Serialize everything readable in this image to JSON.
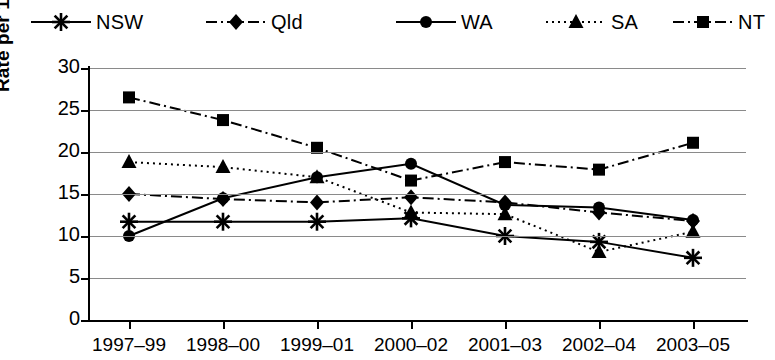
{
  "chart_data": {
    "type": "line",
    "title": "",
    "subtitle": "",
    "xlabel": "",
    "ylabel": "Rate per 1000 live births",
    "categories": [
      "1997–99",
      "1998–00",
      "1999–01",
      "2000–02",
      "2001–03",
      "2002–04",
      "2003–05"
    ],
    "ylim": [
      0,
      30
    ],
    "yticks": [
      0,
      5,
      10,
      15,
      20,
      25,
      30
    ],
    "ytick_labels": [
      "0",
      "5",
      "10",
      "15",
      "20",
      "25",
      "30"
    ],
    "grid": true,
    "grid_axis": "y",
    "legend_position": "top",
    "series": [
      {
        "name": "NSW",
        "marker": "asterisk",
        "line_style": "solid",
        "color": "#000000",
        "values": [
          11.7,
          11.7,
          11.7,
          12.1,
          10.0,
          9.3,
          7.4
        ]
      },
      {
        "name": "Qld",
        "marker": "diamond",
        "line_style": "dash-dot",
        "color": "#000000",
        "values": [
          15.0,
          14.4,
          14.0,
          14.6,
          14.0,
          12.8,
          11.8
        ]
      },
      {
        "name": "WA",
        "marker": "circle",
        "line_style": "solid",
        "color": "#000000",
        "values": [
          10.0,
          14.5,
          17.0,
          18.6,
          13.7,
          13.4,
          11.9
        ]
      },
      {
        "name": "SA",
        "marker": "triangle",
        "line_style": "dotted",
        "color": "#000000",
        "values": [
          18.8,
          18.2,
          17.0,
          12.8,
          12.6,
          8.1,
          10.5
        ]
      },
      {
        "name": "NT",
        "marker": "square",
        "line_style": "dash-dot",
        "color": "#000000",
        "values": [
          26.5,
          23.8,
          20.5,
          16.6,
          18.8,
          17.9,
          21.1
        ]
      }
    ]
  },
  "legend": {
    "items": [
      {
        "label": "NSW",
        "marker": "asterisk",
        "line_style": "solid"
      },
      {
        "label": "Qld",
        "marker": "diamond",
        "line_style": "dash-dot"
      },
      {
        "label": "WA",
        "marker": "circle",
        "line_style": "solid"
      },
      {
        "label": "SA",
        "marker": "triangle",
        "line_style": "dotted"
      },
      {
        "label": "NT",
        "marker": "square",
        "line_style": "dash-dot"
      }
    ]
  },
  "axes": {
    "y_title": "Rate per 1000 live births",
    "y_tick_labels": [
      "30",
      "25",
      "20",
      "15",
      "10",
      "5",
      "0"
    ],
    "x_tick_labels": [
      "1997–99",
      "1998–00",
      "1999–01",
      "2000–02",
      "2001–03",
      "2002–04",
      "2003–05"
    ]
  }
}
